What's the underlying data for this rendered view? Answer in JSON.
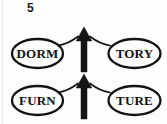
{
  "puzzle": {
    "number": "5",
    "type": "rebus-word-puzzle",
    "rows": [
      {
        "left_word": "DORM",
        "right_word": "TORY",
        "center_icon": "up-arrow"
      },
      {
        "left_word": "FURN",
        "right_word": "TURE",
        "center_icon": "up-arrow"
      }
    ],
    "colors": {
      "ink": "#141414",
      "background": "#fdfdfc",
      "page_edge": "#e7e7e4"
    }
  }
}
